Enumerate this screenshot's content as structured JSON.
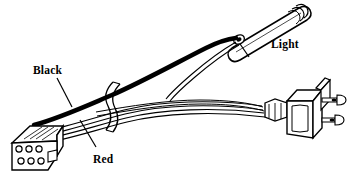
{
  "figure": {
    "background_color": "#ffffff",
    "line_color": "#000000",
    "fill_color": "#ffffff",
    "width": 352,
    "height": 175
  },
  "labels": {
    "black_wire": "Black",
    "red_wire": "Red",
    "light": "Light"
  },
  "components": {
    "connector": {
      "name": "6-pin connector housing",
      "pin_count": 6,
      "pin_rows": 2,
      "pin_columns": 3
    },
    "light": {
      "name": "Tubular light",
      "label": "Light"
    },
    "plug": {
      "name": "Two-prong AC plug",
      "blade_count": 2
    },
    "cable_tie": {
      "name": "Cable tie"
    },
    "wires": [
      {
        "name": "Black wire",
        "label": "Black",
        "color": "#000000"
      },
      {
        "name": "Red wire",
        "label": "Red",
        "color": "#ffffff"
      },
      {
        "name": "White wire",
        "label": "",
        "color": "#ffffff"
      }
    ]
  }
}
